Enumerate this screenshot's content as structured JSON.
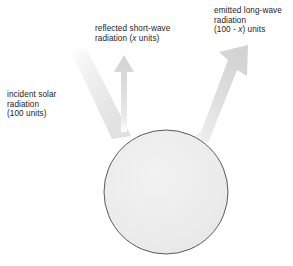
{
  "diagram": {
    "body": {
      "name": "earth-disc",
      "shape": "circle",
      "center_x": 166,
      "center_y": 192,
      "radius": 62,
      "fill_color": "#ededed",
      "stroke_color": "#5a5a5a"
    },
    "beam_color_light": "#f2f2f2",
    "beam_color_dark": "#d9d9d9",
    "labels": {
      "incident": {
        "name": "incident-solar-radiation-label",
        "line1": "incident solar",
        "line2": "radiation",
        "line3": "(100 units)"
      },
      "reflected": {
        "name": "reflected-short-wave-radiation-label",
        "line1": "reflected short-wave",
        "line2_pre": "radiation (",
        "line2_var": "x",
        "line2_post": " units)"
      },
      "emitted": {
        "name": "emitted-long-wave-radiation-label",
        "line1": "emitted long-wave",
        "line2": "radiation",
        "line3_pre": "(100 - ",
        "line3_var": "x",
        "line3_post": ") units"
      }
    },
    "arrows": [
      {
        "name": "incident-solar-beam",
        "direction": "down-right",
        "has_arrowhead": false,
        "units": "100"
      },
      {
        "name": "reflected-short-wave-arrow",
        "direction": "up",
        "has_arrowhead": true,
        "units": "x"
      },
      {
        "name": "emitted-long-wave-arrow",
        "direction": "up-right",
        "has_arrowhead": true,
        "units": "100 - x"
      }
    ]
  }
}
